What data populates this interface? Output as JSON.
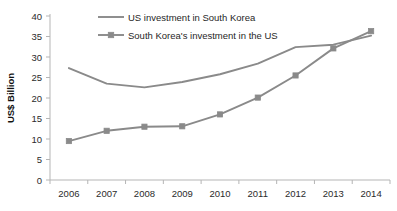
{
  "chart_data": {
    "type": "line",
    "title": "",
    "xlabel": "",
    "ylabel": "US$ Billion",
    "categories": [
      "2006",
      "2007",
      "2008",
      "2009",
      "2010",
      "2011",
      "2012",
      "2013",
      "2014"
    ],
    "ylim": [
      0,
      40
    ],
    "ytick_step": 5,
    "yticks": [
      "0",
      "5",
      "10",
      "15",
      "20",
      "25",
      "30",
      "35",
      "40"
    ],
    "grid": false,
    "legend_position": "top-center",
    "series": [
      {
        "name": "US investment in South Korea",
        "marker": "none",
        "color": "#8a8a8a",
        "values": [
          27.3,
          23.5,
          22.6,
          23.9,
          25.8,
          28.4,
          32.4,
          33.0,
          35.2
        ]
      },
      {
        "name": "South Korea's investment in the US",
        "marker": "square",
        "color": "#8a8a8a",
        "values": [
          9.5,
          12.0,
          13.0,
          13.1,
          16.0,
          20.1,
          25.5,
          32.1,
          36.3
        ]
      }
    ],
    "colors": {
      "series_line": "#8a8a8a",
      "axis": "#b5b5b5",
      "tick_text": "#2b2b2b",
      "background": "#ffffff"
    }
  }
}
